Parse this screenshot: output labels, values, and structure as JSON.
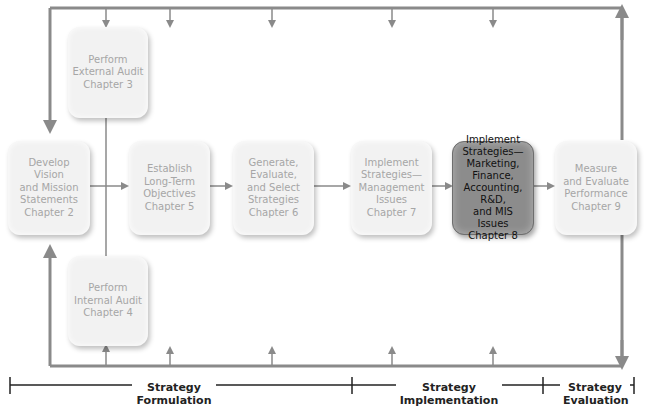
{
  "diagram": {
    "type": "flowchart",
    "colors": {
      "box_fill": "#f2f2f2",
      "box_text": "#a6a6a6",
      "active_fill": "#8c8c8c",
      "active_text": "#111111",
      "connector": "#8a8a8a",
      "scale_line": "#222222"
    },
    "nodes": [
      {
        "id": "external_audit",
        "text": "Perform\nExternal Audit\nChapter 3",
        "active": false
      },
      {
        "id": "vision_mission",
        "text": "Develop Vision\nand Mission\nStatements\nChapter 2",
        "active": false
      },
      {
        "id": "objectives",
        "text": "Establish\nLong-Term\nObjectives\nChapter 5",
        "active": false
      },
      {
        "id": "strategies",
        "text": "Generate,\nEvaluate,\nand Select\nStrategies\nChapter 6",
        "active": false
      },
      {
        "id": "impl_management",
        "text": "Implement\nStrategies—\nManagement\nIssues\nChapter 7",
        "active": false
      },
      {
        "id": "impl_functional",
        "text": "Implement\nStrategies—\nMarketing,\nFinance,\nAccounting, R&D,\nand MIS Issues\nChapter 8",
        "active": true
      },
      {
        "id": "measure",
        "text": "Measure\nand Evaluate\nPerformance\nChapter 9",
        "active": false
      },
      {
        "id": "internal_audit",
        "text": "Perform\nInternal Audit\nChapter 4",
        "active": false
      }
    ],
    "edges": [
      {
        "from": "vision_mission",
        "to": "objectives"
      },
      {
        "from": "external_audit",
        "to": "objectives"
      },
      {
        "from": "internal_audit",
        "to": "objectives"
      },
      {
        "from": "objectives",
        "to": "strategies"
      },
      {
        "from": "strategies",
        "to": "impl_management"
      },
      {
        "from": "impl_management",
        "to": "impl_functional"
      },
      {
        "from": "impl_functional",
        "to": "measure"
      },
      {
        "from": "measure",
        "to": "feedback_loop_top"
      },
      {
        "from": "measure",
        "to": "feedback_loop_bottom"
      },
      {
        "from": "feedback_loop_top",
        "to": "vision_mission"
      },
      {
        "from": "feedback_loop_bottom",
        "to": "vision_mission"
      }
    ],
    "phases": [
      {
        "label": "Strategy\nFormulation"
      },
      {
        "label": "Strategy\nImplementation"
      },
      {
        "label": "Strategy\nEvaluation"
      }
    ]
  }
}
